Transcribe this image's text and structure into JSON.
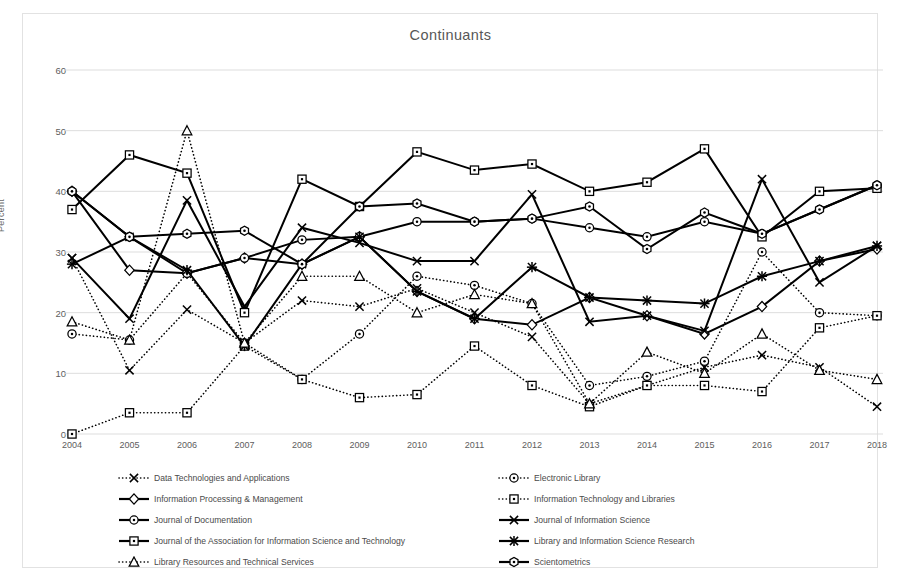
{
  "chart_data": {
    "type": "line",
    "title": "Continuants",
    "xlabel": "",
    "ylabel": "Percent",
    "ylim": [
      0,
      60
    ],
    "yticks": [
      0,
      10,
      20,
      30,
      40,
      50,
      60
    ],
    "grid": true,
    "legend_position": "bottom",
    "x": [
      2004,
      2005,
      2006,
      2007,
      2008,
      2009,
      2010,
      2011,
      2012,
      2013,
      2014,
      2015,
      2016,
      2017,
      2018
    ],
    "categories": [
      "2004",
      "2005",
      "2006",
      "2007",
      "2008",
      "2009",
      "2010",
      "2011",
      "2012",
      "2013",
      "2014",
      "2015",
      "2016",
      "2017",
      "2018"
    ],
    "series": [
      {
        "name": "Data Technologies and Applications",
        "marker": "x-dotted",
        "style": "dotted",
        "values": [
          29,
          10.5,
          20.5,
          15,
          22,
          21,
          24,
          20,
          16,
          5,
          8,
          11,
          13,
          11,
          4.5
        ]
      },
      {
        "name": "Electronic Library",
        "marker": "circle-dotted",
        "style": "dotted",
        "values": [
          16.5,
          15.5,
          26.5,
          15,
          9,
          16.5,
          26,
          24.5,
          21.5,
          8,
          9.5,
          12,
          30,
          20,
          19.5
        ]
      },
      {
        "name": "Information Processing & Management",
        "marker": "diamond-solid",
        "style": "solid",
        "values": [
          40,
          27,
          26.5,
          29,
          28,
          32.5,
          23.5,
          19,
          18,
          22.5,
          19.5,
          16.5,
          21,
          28.5,
          30.5
        ]
      },
      {
        "name": "Information Technology and Libraries",
        "marker": "square-dotted",
        "style": "dotted",
        "values": [
          0,
          3.5,
          3.5,
          14.5,
          9,
          6,
          6.5,
          14.5,
          8,
          4.5,
          8,
          8,
          7,
          17.5,
          19.5
        ]
      },
      {
        "name": "Journal of Documentation",
        "marker": "circle-solid",
        "style": "solid",
        "values": [
          40,
          32.5,
          26.5,
          29,
          32,
          32.5,
          35,
          35,
          35.5,
          34,
          32.5,
          35,
          33,
          37,
          41
        ]
      },
      {
        "name": "Journal of Information Science",
        "marker": "x-solid",
        "style": "solid",
        "values": [
          29,
          19,
          38.5,
          21,
          34,
          31.5,
          28.5,
          28.5,
          39.5,
          18.5,
          19.5,
          17,
          42,
          25,
          31
        ]
      },
      {
        "name": "Journal of the Association for Information Science and Technology",
        "marker": "square-solid",
        "style": "solid",
        "values": [
          37,
          46,
          43,
          20,
          42,
          37.5,
          46.5,
          43.5,
          44.5,
          40,
          41.5,
          47,
          32.5,
          40,
          40.5
        ]
      },
      {
        "name": "Library and Information Science Research",
        "marker": "star-solid",
        "style": "solid",
        "values": [
          28,
          32.5,
          27,
          14.5,
          28,
          32.5,
          23.5,
          19,
          27.5,
          22.5,
          22,
          21.5,
          26,
          28.5,
          31
        ]
      },
      {
        "name": "Library Resources and Technical Services",
        "marker": "triangle-dotted",
        "style": "dotted",
        "values": [
          18.5,
          15.5,
          50,
          15,
          26,
          26,
          20,
          23,
          21.5,
          5,
          13.5,
          10,
          16.5,
          10.5,
          9
        ]
      },
      {
        "name": "Scientometrics",
        "marker": "hex-solid",
        "style": "solid",
        "values": [
          40,
          32.5,
          33,
          33.5,
          28,
          37.5,
          38,
          35,
          35.5,
          37.5,
          30.5,
          36.5,
          33,
          37,
          41
        ]
      }
    ]
  },
  "legend_rows": [
    [
      "Data Technologies and Applications",
      "Electronic Library"
    ],
    [
      "Information Processing & Management",
      "Information Technology and Libraries"
    ],
    [
      "Journal of Documentation",
      "Journal of Information Science"
    ],
    [
      "Journal of the Association for Information Science and Technology",
      "Library and Information Science Research"
    ],
    [
      "Library Resources and Technical Services",
      "Scientometrics"
    ]
  ],
  "colors": {
    "line": "#000000",
    "grid": "#d9d9d9",
    "text": "#595959",
    "frame": "#e2e2e2",
    "background": "#ffffff"
  }
}
